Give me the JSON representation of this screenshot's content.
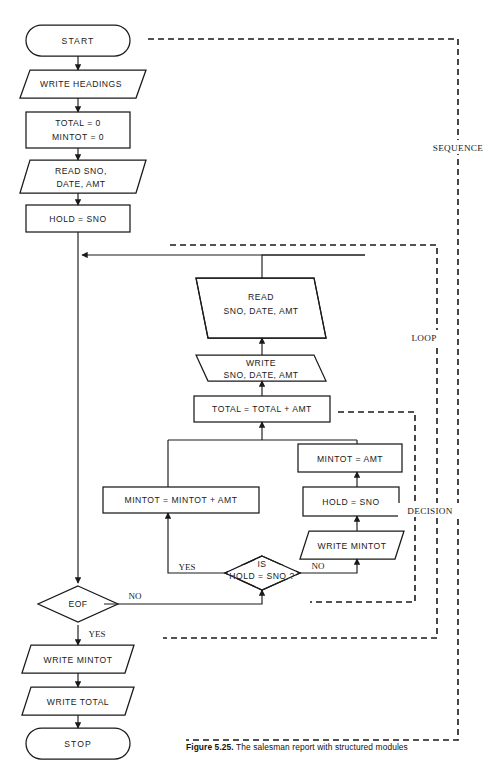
{
  "figure": {
    "caption_number": "Figure 5.25.",
    "caption_text": "The salesman report with structured modules",
    "top_partial_text": ""
  },
  "module_labels": {
    "sequence": "SEQUENCE",
    "loop": "LOOP",
    "decision": "DECISION"
  },
  "nodes": {
    "start": {
      "label": "START",
      "type": "terminator"
    },
    "write_headings": {
      "label": "WRITE  HEADINGS",
      "type": "io"
    },
    "init_totals": {
      "line1": "TOTAL  =  0",
      "line2": "MINTOT  =  0",
      "type": "process"
    },
    "read_first": {
      "line1": "READ SNO,",
      "line2": "DATE,  AMT",
      "type": "io"
    },
    "hold_sno_first": {
      "label": "HOLD  =  SNO",
      "type": "process"
    },
    "read_loop": {
      "line1": "READ",
      "line2": "SNO,  DATE,  AMT",
      "type": "io"
    },
    "write_loop": {
      "line1": "WRITE",
      "line2": "SNO,  DATE,  AMT",
      "type": "io"
    },
    "total_accum": {
      "label": "TOTAL  =  TOTAL  +  AMT",
      "type": "process"
    },
    "mintot_accum": {
      "label": "MINTOT  =  MINTOT  +  AMT",
      "type": "process"
    },
    "mintot_reset": {
      "label": "MINTOT  =  AMT",
      "type": "process"
    },
    "hold_sno_reset": {
      "label": "HOLD  =  SNO",
      "type": "process"
    },
    "write_mintot_break": {
      "label": "WRITE  MINTOT",
      "type": "io"
    },
    "hold_decision": {
      "line1": "IS",
      "line2": "HOLD  =  SNO  ?",
      "type": "decision"
    },
    "eof_decision": {
      "label": "EOF",
      "type": "decision"
    },
    "write_mintot_final": {
      "label": "WRITE  MINTOT",
      "type": "io"
    },
    "write_total_final": {
      "label": "WRITE  TOTAL",
      "type": "io"
    },
    "stop": {
      "label": "STOP",
      "type": "terminator"
    }
  },
  "branch_labels": {
    "hold_yes": "YES",
    "hold_no": "NO",
    "eof_no": "NO",
    "eof_yes": "YES"
  },
  "colors": {
    "ink": "#1a1a1a",
    "background": "#ffffff"
  }
}
